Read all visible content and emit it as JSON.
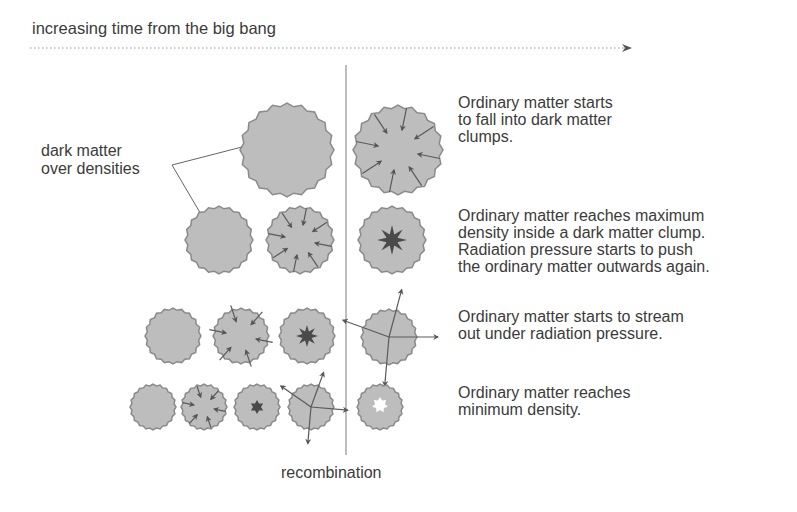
{
  "header": {
    "title": "increasing time from the big bang",
    "arrow": "time-arrow"
  },
  "labels": {
    "dark_matter": "dark matter\nover densities",
    "divider": "recombination"
  },
  "rows": [
    {
      "description": "Ordinary matter starts\nto fall into dark matter\nclumps.",
      "stages_before": 1,
      "stage_after": "infall-arrows"
    },
    {
      "description": "Ordinary matter reaches maximum\ndensity inside a dark matter clump.\nRadiation pressure starts to push\nthe ordinary matter outwards again.",
      "stages_before": 2,
      "stage_after": "dense-core"
    },
    {
      "description": "Ordinary matter starts to stream\nout under radiation pressure.",
      "stages_before": 3,
      "stage_after": "outflow-arrows"
    },
    {
      "description": "Ordinary matter reaches\nminimum density.",
      "stages_before": 4,
      "stage_after": "void-core"
    }
  ],
  "colors": {
    "clump_fill": "#bdbdbd",
    "clump_edge": "#8a8a8a",
    "arrow": "#5a5a5a",
    "core": "#4a4a4a",
    "text": "#3b3b3b",
    "divider": "#9a9a9a"
  }
}
